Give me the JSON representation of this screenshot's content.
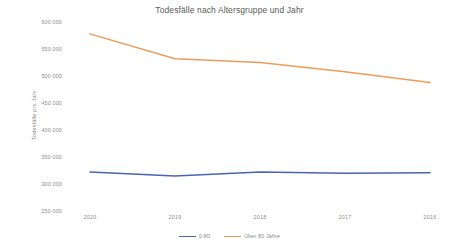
{
  "chart_data": {
    "type": "line",
    "title": "Todesfälle nach Altersgruppe und Jahr",
    "xlabel": "",
    "ylabel": "Todesfälle pro Jahr",
    "categories": [
      "2020",
      "2019",
      "2018",
      "2017",
      "2016"
    ],
    "ylim": [
      250000,
      600000
    ],
    "ytick_step": 50000,
    "ytick_labels": [
      "600 000",
      "550 000",
      "500 000",
      "450 000",
      "400 000",
      "350 000",
      "300 000",
      "250 000"
    ],
    "ytick_values": [
      600000,
      550000,
      500000,
      450000,
      400000,
      350000,
      300000,
      250000
    ],
    "grid": false,
    "legend_position": "bottom",
    "series": [
      {
        "name": "0-80",
        "color": "#4a63b4",
        "values": [
          322000,
          315000,
          322000,
          320000,
          321000
        ]
      },
      {
        "name": "Über 80 Jahre",
        "color": "#ed9b57",
        "values": [
          578000,
          532000,
          525000,
          508000,
          488000
        ]
      }
    ]
  },
  "legend": {
    "items": [
      {
        "label": "0-80",
        "color": "#4a63b4"
      },
      {
        "label": "Über 80 Jahre",
        "color": "#ed9b57"
      }
    ]
  }
}
